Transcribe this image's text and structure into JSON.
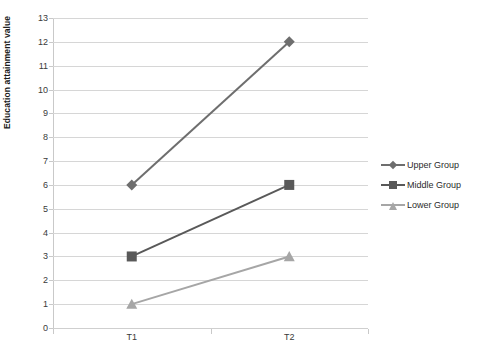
{
  "chart_data": {
    "type": "line",
    "title": "",
    "xlabel": "",
    "ylabel": "Education attainment value",
    "categories": [
      "T1",
      "T2"
    ],
    "x": [
      "T1",
      "T2"
    ],
    "ylim": [
      0,
      13
    ],
    "ytick_step": 1,
    "yticks": [
      0,
      1,
      2,
      3,
      4,
      5,
      6,
      7,
      8,
      9,
      10,
      11,
      12,
      13
    ],
    "ytick_labels": [
      "0",
      "1",
      "2",
      "3",
      "4",
      "5",
      "6",
      "7",
      "8",
      "9",
      "10",
      "11",
      "12",
      "13"
    ],
    "grid": true,
    "legend_position": "right",
    "series": [
      {
        "name": "Upper Group",
        "values": [
          6,
          12
        ],
        "marker": "diamond",
        "color": "#6e6e6e"
      },
      {
        "name": "Middle Group",
        "values": [
          3,
          6
        ],
        "marker": "square",
        "color": "#595959"
      },
      {
        "name": "Lower Group",
        "values": [
          1,
          3
        ],
        "marker": "triangle",
        "color": "#a6a6a6"
      }
    ]
  },
  "axes": {
    "y_title": "Education attainment value",
    "y_labels": [
      "13",
      "12",
      "11",
      "10",
      "9",
      "8",
      "7",
      "6",
      "5",
      "4",
      "3",
      "2",
      "1",
      "0"
    ],
    "x_labels": [
      "T1",
      "T2"
    ]
  },
  "legend": {
    "entries": [
      {
        "label": "Upper Group",
        "color": "#6e6e6e",
        "marker": "diamond"
      },
      {
        "label": "Middle Group",
        "color": "#595959",
        "marker": "square"
      },
      {
        "label": "Lower Group",
        "color": "#a6a6a6",
        "marker": "triangle"
      }
    ]
  },
  "colors": {
    "gridline": "#d6d6d6",
    "axis": "#c9c9c9",
    "background": "#ffffff",
    "text": "#3a3a3a"
  }
}
